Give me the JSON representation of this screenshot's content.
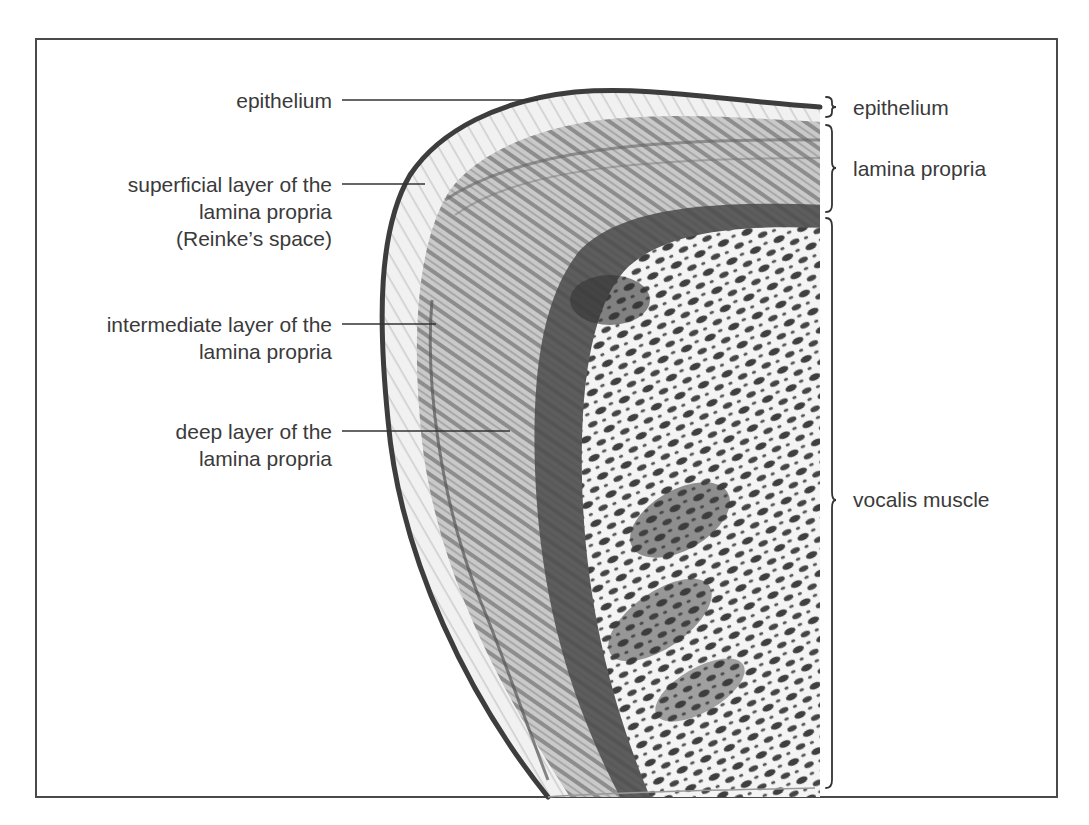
{
  "figure": {
    "type": "anatomical cross-section illustration"
  },
  "left_labels": [
    {
      "id": "epithelium",
      "lines": [
        "epithelium"
      ]
    },
    {
      "id": "superficial",
      "lines": [
        "superficial layer of the",
        "lamina propria",
        "(Reinke’s space)"
      ]
    },
    {
      "id": "intermediate",
      "lines": [
        "intermediate layer of the",
        "lamina propria"
      ]
    },
    {
      "id": "deep",
      "lines": [
        "deep layer of the",
        "lamina propria"
      ]
    }
  ],
  "right_labels": [
    {
      "id": "epithelium",
      "text": "epithelium"
    },
    {
      "id": "lamina-propria",
      "text": "lamina propria"
    },
    {
      "id": "vocalis-muscle",
      "text": "vocalis muscle"
    }
  ],
  "colors": {
    "frame": "#4a4a4a",
    "text": "#3a3a3a",
    "tissue_dark": "#3c3c3c",
    "tissue_mid": "#8a8a8a",
    "tissue_light": "#d6d6d6"
  }
}
